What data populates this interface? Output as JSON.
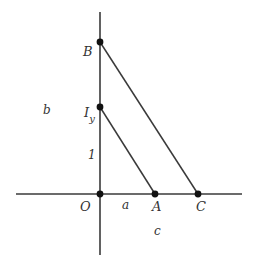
{
  "diagram": {
    "type": "geometry-coordinate-figure",
    "axes": {
      "x_axis": {
        "from": [
          16,
          194
        ],
        "to": [
          242,
          194
        ]
      },
      "y_axis": {
        "from": [
          100,
          12
        ],
        "to": [
          100,
          255
        ]
      }
    },
    "points": [
      {
        "id": "O",
        "label": "O",
        "x": 100,
        "y": 194,
        "label_x": 80,
        "label_y": 211
      },
      {
        "id": "A",
        "label": "A",
        "x": 155,
        "y": 194,
        "label_x": 153,
        "label_y": 211
      },
      {
        "id": "C",
        "label": "C",
        "x": 198,
        "y": 194,
        "label_x": 197,
        "label_y": 211
      },
      {
        "id": "B",
        "label": "B",
        "x": 100,
        "y": 42,
        "label_x": 84,
        "label_y": 56
      },
      {
        "id": "Iy",
        "label": "I",
        "subscript": "y",
        "x": 100,
        "y": 107,
        "label_x": 83,
        "label_y": 118
      }
    ],
    "segments": [
      {
        "id": "Iy-A",
        "from": "Iy",
        "to": "A"
      },
      {
        "id": "B-C",
        "from": "B",
        "to": "C"
      }
    ],
    "annotations": [
      {
        "id": "b",
        "text": "b",
        "x": 43,
        "y": 114
      },
      {
        "id": "one",
        "text": "1",
        "x": 88,
        "y": 159,
        "italic": true
      },
      {
        "id": "a",
        "text": "a",
        "x": 122,
        "y": 209
      },
      {
        "id": "c",
        "text": "c",
        "x": 154,
        "y": 235
      }
    ],
    "colors": {
      "line": "#3a3a3a",
      "point": "#111111",
      "text": "#333333",
      "background": "#ffffff"
    }
  }
}
